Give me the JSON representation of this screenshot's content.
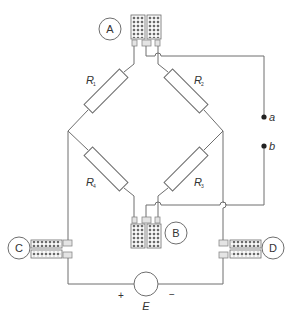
{
  "diagram": {
    "title": "",
    "type": "wheatstone-bridge-strain-gauge-circuit",
    "gauges": [
      {
        "id": "A",
        "label": "A"
      },
      {
        "id": "B",
        "label": "B"
      },
      {
        "id": "C",
        "label": "C"
      },
      {
        "id": "D",
        "label": "D"
      }
    ],
    "resistors": [
      {
        "id": "R1",
        "symbol": "R",
        "subscript": "1"
      },
      {
        "id": "R2",
        "symbol": "R",
        "subscript": "2"
      },
      {
        "id": "R3",
        "symbol": "R",
        "subscript": "3"
      },
      {
        "id": "R4",
        "symbol": "R",
        "subscript": "4"
      }
    ],
    "terminals": [
      {
        "id": "a",
        "label": "a"
      },
      {
        "id": "b",
        "label": "b"
      }
    ],
    "source": {
      "label": "E",
      "plus": "+",
      "minus": "−"
    },
    "colors": {
      "line": "#6e6e6e",
      "text": "#333333",
      "tab_fill": "#e4e4e4"
    }
  }
}
